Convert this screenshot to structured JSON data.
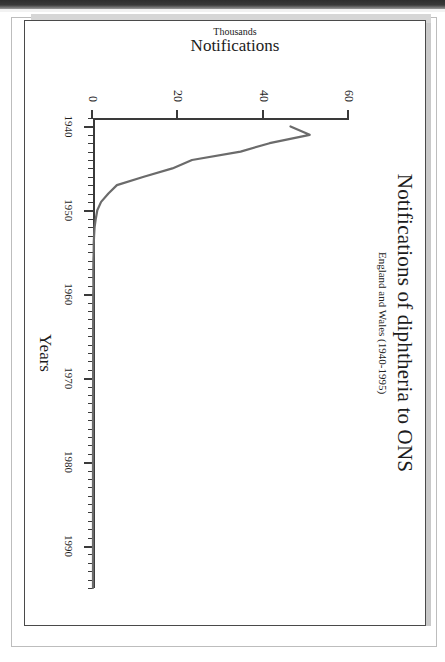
{
  "chart_data": {
    "type": "line",
    "title": "Notifications of diphtheria to ONS",
    "subtitle": "England and Wales (1940-1995)",
    "xlabel": "Years",
    "ylabel": "Notifications",
    "ylabel_sub": "Thousands",
    "xlim": [
      1939,
      1995
    ],
    "ylim": [
      0,
      60
    ],
    "xticks": [
      1940,
      1950,
      1960,
      1970,
      1980,
      1990
    ],
    "xtick_labels": [
      "1940",
      "1950",
      "1960",
      "1970",
      "1980",
      "1990"
    ],
    "yticks": [
      0,
      20,
      40,
      60
    ],
    "ytick_labels": [
      "0",
      "20",
      "40",
      "60"
    ],
    "minor_xtick_interval": 1,
    "grid": false,
    "legend": false,
    "line_color": "#6b6b6b",
    "axis_color": "#3a3a3a",
    "series": [
      {
        "name": "Diphtheria notifications",
        "x": [
          1940,
          1941,
          1942,
          1943,
          1944,
          1945,
          1946,
          1947,
          1948,
          1949,
          1950,
          1951,
          1952,
          1953,
          1954,
          1955,
          1956,
          1957,
          1958,
          1959,
          1960,
          1965,
          1970,
          1975,
          1980,
          1985,
          1990,
          1995
        ],
        "values": [
          46.3,
          50.8,
          41.4,
          34.6,
          23.2,
          18.6,
          11.9,
          5.6,
          3.6,
          1.9,
          1.0,
          0.66,
          0.38,
          0.25,
          0.17,
          0.16,
          0.1,
          0.06,
          0.08,
          0.09,
          0.05,
          0.03,
          0.02,
          0.01,
          0.01,
          0.01,
          0.01,
          0.01
        ]
      }
    ]
  },
  "scan": {
    "top_band_label": "scan-edge-band"
  }
}
